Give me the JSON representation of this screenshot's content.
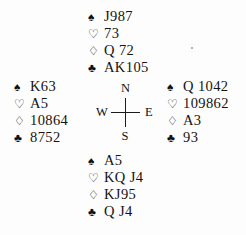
{
  "diagram": {
    "type": "bridge-hand-deal",
    "pips": {
      "spade": "♠",
      "heart": "♡",
      "diamond": "♢",
      "club": "♣"
    },
    "compass": {
      "north": "N",
      "south": "S",
      "west": "W",
      "east": "E"
    },
    "hands": {
      "north": {
        "position": "North",
        "spades": "J987",
        "hearts": "73",
        "diamonds": "Q 72",
        "clubs": "AK105"
      },
      "west": {
        "position": "West",
        "spades": "K63",
        "hearts": "A5",
        "diamonds": "10864",
        "clubs": "8752"
      },
      "east": {
        "position": "East",
        "spades": "Q 1042",
        "hearts": "109862",
        "diamonds": "A3",
        "clubs": "93"
      },
      "south": {
        "position": "South",
        "spades": "A5",
        "hearts": "KQ J4",
        "diamonds": "KJ95",
        "clubs": "Q J4"
      }
    }
  }
}
